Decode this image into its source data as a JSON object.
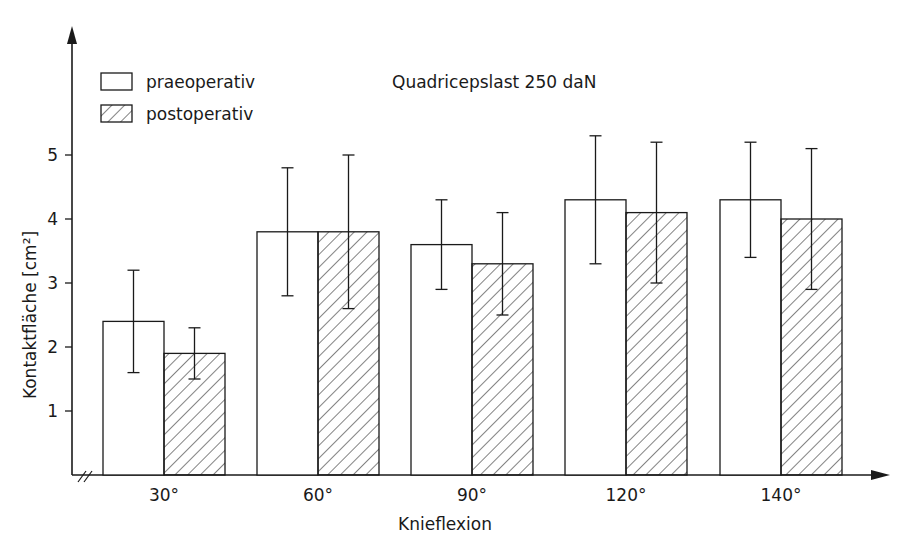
{
  "chart_data": {
    "type": "bar",
    "title": "Quadricepslast 250 daN",
    "xlabel": "Knieflexion",
    "ylabel": "Kontaktfläche [cm²]",
    "ylim": [
      0,
      6
    ],
    "yticks": [
      1,
      2,
      3,
      4,
      5
    ],
    "categories": [
      "30°",
      "60°",
      "90°",
      "120°",
      "140°"
    ],
    "legend_position": "top-left",
    "grid": false,
    "series": [
      {
        "name": "praeoperativ",
        "pattern": "none",
        "values": [
          2.4,
          3.8,
          3.6,
          4.3,
          4.3
        ],
        "err_upper": [
          3.2,
          4.8,
          4.3,
          5.3,
          5.2
        ],
        "err_lower": [
          1.6,
          2.8,
          2.9,
          3.3,
          3.4
        ]
      },
      {
        "name": "postoperativ",
        "pattern": "hatched",
        "values": [
          1.9,
          3.8,
          3.3,
          4.1,
          4.0
        ],
        "err_upper": [
          2.3,
          5.0,
          4.1,
          5.2,
          5.1
        ],
        "err_lower": [
          1.5,
          2.6,
          2.5,
          3.0,
          2.9
        ]
      }
    ]
  },
  "colors": {
    "ink": "#1a1a1a",
    "background": "#ffffff"
  }
}
